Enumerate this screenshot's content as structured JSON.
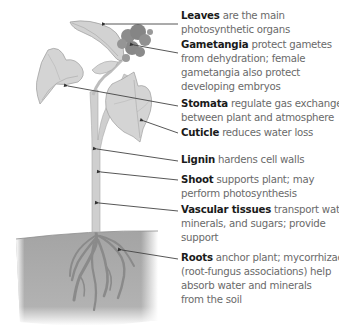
{
  "diagram": {
    "type": "labeled plant anatomy diagram",
    "colors": {
      "background": "#ffffff",
      "plant": "#c8c8c8",
      "soil": "#a6a6a6",
      "leader_lines": "#4a4a4a",
      "term_text": "#1a1a1a",
      "description_text": "#6a6a6a"
    },
    "labels": [
      {
        "term": "Leaves",
        "lines": [
          "are the main",
          "photosynthetic organs"
        ],
        "target": "leaf"
      },
      {
        "term": "Gametangia",
        "lines": [
          "protect gametes",
          "from dehydration; female",
          "gametangia also protect",
          "developing embryos"
        ],
        "target": "gametangia cluster"
      },
      {
        "term": "Stomata",
        "lines": [
          "regulate gas exchange",
          "between plant and atmosphere"
        ],
        "target": "left leaf underside"
      },
      {
        "term": "Cuticle",
        "lines": [
          "reduces water loss"
        ],
        "target": "heart-shaped leaf surface"
      },
      {
        "term": "Lignin",
        "lines": [
          "hardens cell walls"
        ],
        "target": "stem junction"
      },
      {
        "term": "Shoot",
        "lines": [
          "supports plant; may",
          "perform photosynthesis"
        ],
        "target": "stem"
      },
      {
        "term": "Vascular tissues",
        "lines": [
          "transport water,",
          "minerals, and sugars; provide",
          "support"
        ],
        "target": "lower stem"
      },
      {
        "term": "Roots",
        "lines": [
          "anchor plant; mycorrhizae",
          "(root-fungus associations) help",
          "absorb water and minerals",
          "from the soil"
        ],
        "target": "roots in soil"
      }
    ]
  }
}
